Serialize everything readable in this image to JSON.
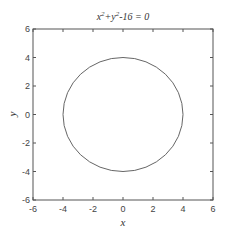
{
  "chart_data": {
    "type": "line",
    "title_parts": {
      "x": "x",
      "sup1": "2",
      "plus": "+y",
      "sup2": "2",
      "rest": "-16 = 0"
    },
    "xlabel": "x",
    "ylabel": "y",
    "xlim": [
      -6,
      6
    ],
    "ylim": [
      -6,
      6
    ],
    "xticks": [
      -6,
      -4,
      -2,
      0,
      2,
      4,
      6
    ],
    "yticks": [
      -6,
      -4,
      -2,
      0,
      2,
      4,
      6
    ],
    "xtick_labels": [
      "-6",
      "-4",
      "-2",
      "0",
      "2",
      "4",
      "6"
    ],
    "ytick_labels": [
      "-6",
      "-4",
      "-2",
      "0",
      "2",
      "4",
      "6"
    ],
    "grid": false,
    "legend": null,
    "series": [
      {
        "name": "implicit curve x^2+y^2-16=0",
        "shape": "circle",
        "center": [
          0,
          0
        ],
        "radius": 4,
        "color": "#555555"
      }
    ]
  },
  "colors": {
    "axes": "#555555",
    "curve": "#666666",
    "background": "#ffffff"
  }
}
